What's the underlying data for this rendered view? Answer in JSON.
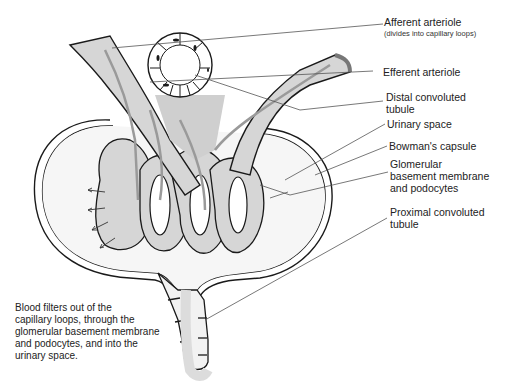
{
  "diagram": {
    "labels": {
      "afferent": "Afferent arteriole",
      "afferent_note": "(divides into capillary loops)",
      "efferent": "Efferent arteriole",
      "distal_1": "Distal convoluted",
      "distal_2": "tubule",
      "urinary": "Urinary space",
      "bowman": "Bowman's capsule",
      "gbm_1": "Glomerular",
      "gbm_2": "basement membrane",
      "gbm_3": "and podocytes",
      "proximal_1": "Proximal convoluted",
      "proximal_2": "tubule"
    },
    "caption": [
      "Blood filters out of the",
      "capillary loops, through the",
      "glomerular basement membrane",
      "and podocytes, and into the",
      "urinary space."
    ],
    "colors": {
      "outline": "#1a1a1a",
      "vessel_fill": "#d6d6d6",
      "flow_arrow": "#9a9a9a",
      "leader_line": "#555555"
    }
  }
}
